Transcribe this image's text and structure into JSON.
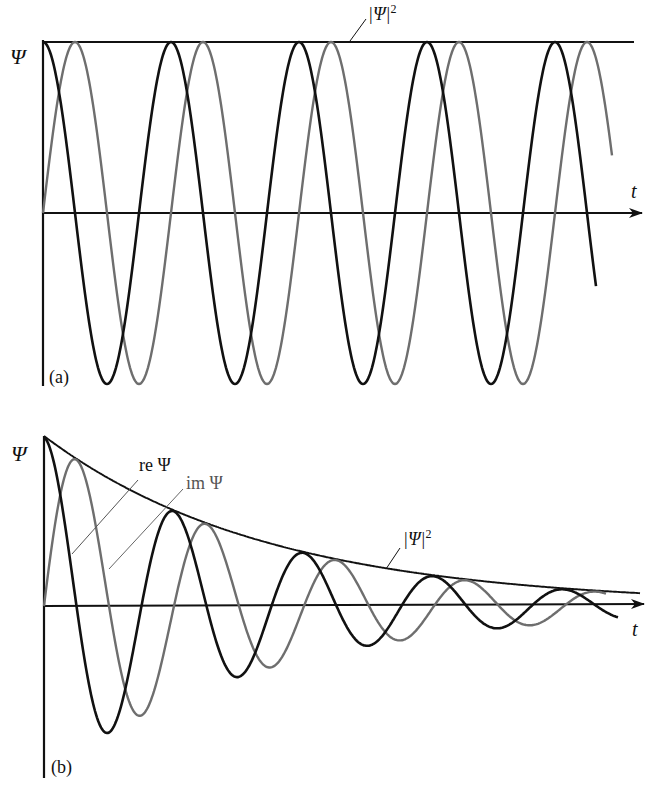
{
  "figure": {
    "panel_a": {
      "panel_label": "(a)",
      "y_axis_label": "Ψ",
      "x_axis_label": "t",
      "envelope_label": "|Ψ|",
      "envelope_exponent": "2"
    },
    "panel_b": {
      "panel_label": "(b)",
      "y_axis_label": "Ψ",
      "x_axis_label": "t",
      "re_label": "re Ψ",
      "im_label": "im Ψ",
      "envelope_label": "|Ψ|",
      "envelope_exponent": "2"
    },
    "colors": {
      "real_part": "#111111",
      "imag_part": "#6e6e6e",
      "envelope": "#111111",
      "axes": "#111111"
    }
  },
  "chart_data": [
    {
      "type": "line",
      "title": "(a) Stationary oscillation",
      "xlabel": "t",
      "ylabel": "Ψ",
      "grid": false,
      "series": [
        {
          "name": "re Ψ",
          "function": "cos(ωt)",
          "color": "#111111"
        },
        {
          "name": "im Ψ",
          "function": "sin(ωt)",
          "color": "#6e6e6e"
        },
        {
          "name": "|Ψ|^2",
          "function": "constant = 1",
          "color": "#111111"
        }
      ],
      "periods_shown": 4.3
    },
    {
      "type": "line",
      "title": "(b) Damped oscillation",
      "xlabel": "t",
      "ylabel": "Ψ",
      "grid": false,
      "series": [
        {
          "name": "re Ψ",
          "function": "e^(-γt) cos(ωt)",
          "color": "#111111"
        },
        {
          "name": "im Ψ",
          "function": "e^(-γt) sin(ωt)",
          "color": "#6e6e6e"
        },
        {
          "name": "|Ψ|^2",
          "function": "e^(-γt) envelope",
          "color": "#111111"
        }
      ],
      "periods_shown": 4.5,
      "envelope_ratio_per_period": 0.55
    }
  ]
}
